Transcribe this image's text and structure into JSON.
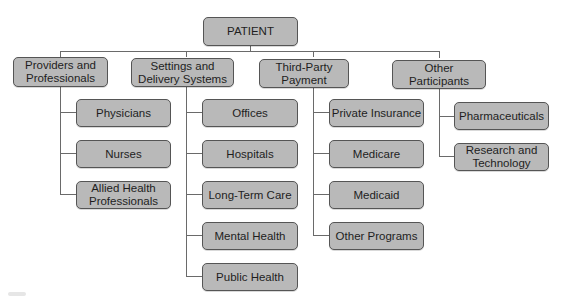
{
  "diagram": {
    "root": {
      "label": "PATIENT"
    },
    "categories": [
      {
        "label_lines": [
          "Providers and",
          "Professionals"
        ],
        "children": [
          {
            "label_lines": [
              "Physicians"
            ]
          },
          {
            "label_lines": [
              "Nurses"
            ]
          },
          {
            "label_lines": [
              "Allied Health",
              "Professionals"
            ]
          }
        ]
      },
      {
        "label_lines": [
          "Settings and",
          "Delivery Systems"
        ],
        "children": [
          {
            "label_lines": [
              "Offices"
            ]
          },
          {
            "label_lines": [
              "Hospitals"
            ]
          },
          {
            "label_lines": [
              "Long-Term Care"
            ]
          },
          {
            "label_lines": [
              "Mental Health"
            ]
          },
          {
            "label_lines": [
              "Public Health"
            ]
          }
        ]
      },
      {
        "label_lines": [
          "Third-Party",
          "Payment"
        ],
        "children": [
          {
            "label_lines": [
              "Private Insurance"
            ]
          },
          {
            "label_lines": [
              "Medicare"
            ]
          },
          {
            "label_lines": [
              "Medicaid"
            ]
          },
          {
            "label_lines": [
              "Other Programs"
            ]
          }
        ]
      },
      {
        "label_lines": [
          "Other",
          "Participants"
        ],
        "children": [
          {
            "label_lines": [
              "Pharmaceuticals"
            ]
          },
          {
            "label_lines": [
              "Research and",
              "Technology"
            ]
          }
        ]
      }
    ],
    "colors": {
      "box_fill": "#b9b9b9",
      "box_border": "#555555",
      "connector": "#6a6a6a",
      "background": "#ffffff"
    }
  }
}
